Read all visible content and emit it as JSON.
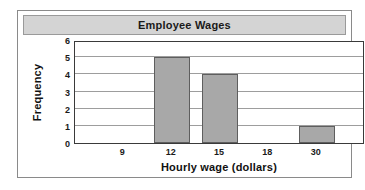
{
  "figure": {
    "title": "Employee Wages"
  },
  "chart_data": {
    "type": "bar",
    "title": "Employee Wages",
    "xlabel": "Hourly wage (dollars)",
    "ylabel": "Frequency",
    "categories": [
      "9",
      "12",
      "15",
      "18",
      "30"
    ],
    "values": [
      0,
      5,
      4,
      0,
      1
    ],
    "xtick_labels": [
      "9",
      "12",
      "15",
      "18",
      "30"
    ],
    "ytick_labels": [
      "0",
      "1",
      "2",
      "3",
      "4",
      "5",
      "6"
    ],
    "ylim": [
      0,
      6
    ],
    "grid": true,
    "legend": null,
    "bar_color": "#a8a8a8",
    "bar_edge_color": "#5e5e5e",
    "title_banner_color": "#d4d4d4"
  }
}
